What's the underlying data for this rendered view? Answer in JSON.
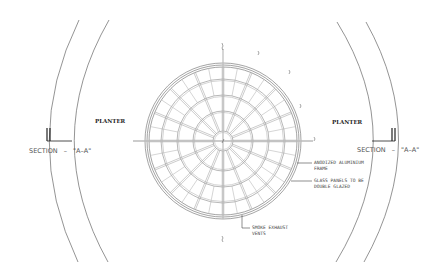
{
  "drawing": {
    "type": "architectural-plan",
    "subject": "circular glazed skylight dome",
    "planter_labels": [
      "PLANTER",
      "PLANTER"
    ],
    "section_left": {
      "text": "SECTION",
      "dash": "–",
      "mark": "\"A–A\""
    },
    "section_right": {
      "text": "SECTION",
      "dash": "–",
      "mark": "\"A–A\""
    },
    "annotations": {
      "frame": [
        "ANODIZED ALUMINIUM",
        "FRAME"
      ],
      "glass": [
        "GLASS PANELS TO BE",
        "DOUBLE GLAZED"
      ],
      "vents": [
        "SMOKE EXHAUST",
        "VENTS"
      ]
    },
    "dome": {
      "rings": 4,
      "radial_ribs": 16
    },
    "colors": {
      "line": "#555555",
      "dark": "#222222",
      "background": "#ffffff"
    }
  }
}
